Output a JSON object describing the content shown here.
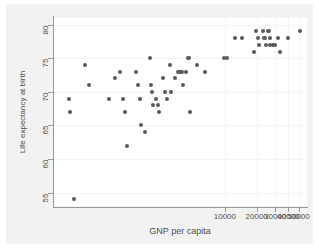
{
  "chart_data": {
    "type": "scatter",
    "title": "",
    "xlabel": "GNP per capita",
    "ylabel": "Life expectancy at birth",
    "xscale": "log",
    "yscale": "linear",
    "xlim": [
      240,
      60000
    ],
    "ylim": [
      53,
      81
    ],
    "grid": true,
    "legend": null,
    "xticks": [
      10000,
      20000,
      30000,
      40000,
      50000
    ],
    "xtick_labels": [
      "10000",
      "20000",
      "30000",
      "40000",
      "50000"
    ],
    "yticks": [
      55,
      60,
      65,
      70,
      75,
      80
    ],
    "ytick_labels": [
      "55",
      "60",
      "65",
      "70",
      "75",
      "80"
    ],
    "marker": "filled-circle",
    "marker_color": "#5a5a5a",
    "points": [
      {
        "x": 330,
        "y": 69
      },
      {
        "x": 340,
        "y": 67
      },
      {
        "x": 370,
        "y": 54
      },
      {
        "x": 470,
        "y": 74
      },
      {
        "x": 520,
        "y": 71
      },
      {
        "x": 790,
        "y": 69
      },
      {
        "x": 900,
        "y": 72
      },
      {
        "x": 1020,
        "y": 73
      },
      {
        "x": 1080,
        "y": 69
      },
      {
        "x": 1120,
        "y": 67
      },
      {
        "x": 1180,
        "y": 62
      },
      {
        "x": 1450,
        "y": 73
      },
      {
        "x": 1500,
        "y": 71
      },
      {
        "x": 1560,
        "y": 69
      },
      {
        "x": 1600,
        "y": 65
      },
      {
        "x": 1750,
        "y": 64
      },
      {
        "x": 1950,
        "y": 75
      },
      {
        "x": 2000,
        "y": 71
      },
      {
        "x": 2050,
        "y": 70
      },
      {
        "x": 2100,
        "y": 68
      },
      {
        "x": 2200,
        "y": 69
      },
      {
        "x": 2300,
        "y": 68
      },
      {
        "x": 2350,
        "y": 67
      },
      {
        "x": 2600,
        "y": 72
      },
      {
        "x": 2700,
        "y": 70
      },
      {
        "x": 2800,
        "y": 69
      },
      {
        "x": 3000,
        "y": 74
      },
      {
        "x": 3100,
        "y": 70
      },
      {
        "x": 3400,
        "y": 72
      },
      {
        "x": 3600,
        "y": 73
      },
      {
        "x": 3700,
        "y": 73
      },
      {
        "x": 3800,
        "y": 73
      },
      {
        "x": 3900,
        "y": 73
      },
      {
        "x": 4000,
        "y": 71
      },
      {
        "x": 4300,
        "y": 73
      },
      {
        "x": 4500,
        "y": 75
      },
      {
        "x": 4600,
        "y": 75
      },
      {
        "x": 4700,
        "y": 67
      },
      {
        "x": 5400,
        "y": 74
      },
      {
        "x": 6500,
        "y": 73
      },
      {
        "x": 9800,
        "y": 75
      },
      {
        "x": 10400,
        "y": 75
      },
      {
        "x": 12500,
        "y": 78
      },
      {
        "x": 14500,
        "y": 78
      },
      {
        "x": 19000,
        "y": 76
      },
      {
        "x": 19500,
        "y": 79
      },
      {
        "x": 20500,
        "y": 78
      },
      {
        "x": 21000,
        "y": 77
      },
      {
        "x": 23000,
        "y": 79
      },
      {
        "x": 23500,
        "y": 78
      },
      {
        "x": 24000,
        "y": 78
      },
      {
        "x": 24500,
        "y": 77
      },
      {
        "x": 25500,
        "y": 79
      },
      {
        "x": 26000,
        "y": 79
      },
      {
        "x": 26500,
        "y": 78
      },
      {
        "x": 27000,
        "y": 77
      },
      {
        "x": 28500,
        "y": 77
      },
      {
        "x": 30000,
        "y": 77
      },
      {
        "x": 32000,
        "y": 78
      },
      {
        "x": 33000,
        "y": 76
      },
      {
        "x": 40000,
        "y": 78
      },
      {
        "x": 52000,
        "y": 79
      }
    ]
  },
  "axes": {
    "x_title": "GNP per capita",
    "y_title": "Life expectancy at birth"
  }
}
